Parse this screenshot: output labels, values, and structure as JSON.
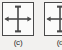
{
  "figure": {
    "background_color": "#f2f1ef",
    "panel_border_color": "#4a4a4a",
    "panel_fill_color": "#fbfbfa",
    "arrow_color": "#4a4a4a",
    "panels": [
      {
        "caption": "(c)",
        "symbol": "bidirectional-cross-arrows",
        "clipped": "false"
      },
      {
        "caption": "(d",
        "symbol": "bidirectional-cross-arrows",
        "clipped": "true"
      }
    ]
  }
}
